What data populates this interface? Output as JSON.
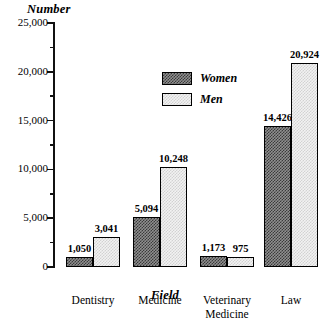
{
  "chart_data": {
    "type": "bar",
    "title": "",
    "xlabel": "Field",
    "ylabel": "Number",
    "ylim": [
      0,
      25000
    ],
    "ytick_step": 5000,
    "yminor_step": 2500,
    "grid": false,
    "legend_position": "center-top-inside",
    "categories": [
      "Dentistry",
      "Medicine",
      "Veterinary Medicine",
      "Law"
    ],
    "category_lines": [
      [
        "Dentistry"
      ],
      [
        "Medicine"
      ],
      [
        "Veterinary",
        "Medicine"
      ],
      [
        "Law"
      ]
    ],
    "ytick_labels": [
      "25,000",
      "20,000",
      "15,000",
      "10,000",
      "5,000",
      "0"
    ],
    "ytick_values": [
      25000,
      20000,
      15000,
      10000,
      5000,
      0
    ],
    "series": [
      {
        "name": "Women",
        "fill": "dark-checker",
        "values": [
          1050,
          5094,
          1173,
          14426
        ],
        "labels": [
          "1,050",
          "5,094",
          "1,173",
          "14,426"
        ]
      },
      {
        "name": "Men",
        "fill": "light-dotted",
        "values": [
          3041,
          10248,
          975,
          20924
        ],
        "labels": [
          "3,041",
          "10,248",
          "975",
          "20,924"
        ]
      }
    ]
  },
  "legend": {
    "items": [
      {
        "label": "Women",
        "swatch": "dark-checker"
      },
      {
        "label": "Men",
        "swatch": "light-dotted"
      }
    ]
  },
  "colors": {
    "axis": "#111111",
    "bar_border": "#000000",
    "women_fill": "#8f8f8f",
    "women_pattern": "#3a3a3a",
    "men_fill": "#f2f2f2",
    "men_pattern": "#d2d2d2",
    "background": "#ffffff",
    "text": "#000000"
  }
}
